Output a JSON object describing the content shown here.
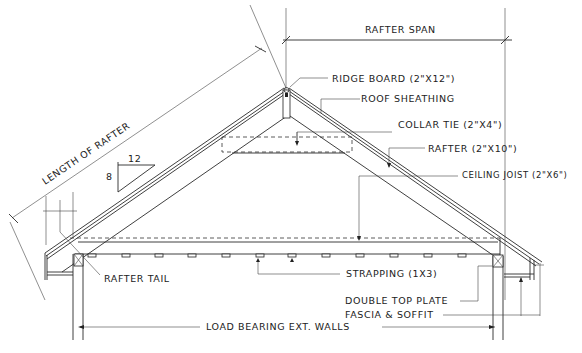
{
  "diagram": {
    "labels": {
      "rafter_span": "RAFTER SPAN",
      "ridge_board": "RIDGE BOARD (2\"X12\")",
      "roof_sheathing": "ROOF SHEATHING",
      "collar_tie": "COLLAR TIE (2\"X4\")",
      "rafter": "RAFTER (2\"X10\")",
      "ceiling_joist": "CEILING JOIST (2\"X6\")",
      "length_of_rafter": "LENGTH OF RAFTER",
      "rafter_tail": "RAFTER TAIL",
      "strapping": "STRAPPING (1X3)",
      "double_top_plate": "DOUBLE TOP PLATE",
      "fascia_soffit": "FASCIA & SOFFIT",
      "load_bearing_walls": "LOAD BEARING EXT. WALLS"
    },
    "pitch": {
      "rise": "8",
      "run": "12"
    }
  }
}
